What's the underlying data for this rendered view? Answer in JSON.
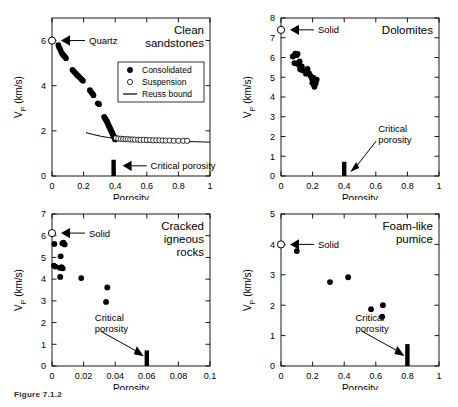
{
  "figure": {
    "caption": "Figure 7.1.2",
    "panel_count": 4
  },
  "chart_data": [
    {
      "type": "scatter",
      "title": "Clean sandstones",
      "xlabel": "Porosity",
      "ylabel": "VP (km/s)",
      "ylabel_main": "V",
      "ylabel_sub": "P",
      "ylabel_unit": " (km/s)",
      "xlim": [
        0,
        1
      ],
      "ylim": [
        0,
        7
      ],
      "xticks": [
        0,
        0.2,
        0.4,
        0.6,
        0.8,
        1
      ],
      "xticklabels": [
        "0",
        "0.2",
        "0.4",
        "0.6",
        "0.8",
        "1"
      ],
      "yticks": [
        0,
        2,
        4,
        6
      ],
      "yticklabels": [
        "0",
        "2",
        "4",
        "6"
      ],
      "grid": false,
      "legend": {
        "position": "upper-right",
        "entries": [
          {
            "label": "Consolidated",
            "marker": "filled-circle"
          },
          {
            "label": "Suspension",
            "marker": "open-circle"
          },
          {
            "label": "Reuss bound",
            "marker": "line"
          }
        ]
      },
      "annotations": [
        {
          "text": "Quartz",
          "marker": "open-circle",
          "x": 0.0,
          "y": 6.0,
          "arrow": "left"
        },
        {
          "text": "Critical porosity",
          "x": 0.39,
          "y": 0.45,
          "arrow": "left"
        }
      ],
      "critical_porosity": 0.39,
      "series": [
        {
          "name": "Consolidated",
          "marker": "filled-circle",
          "points": [
            [
              0.04,
              5.8
            ],
            [
              0.045,
              5.7
            ],
            [
              0.052,
              5.62
            ],
            [
              0.058,
              5.5
            ],
            [
              0.065,
              5.42
            ],
            [
              0.072,
              5.35
            ],
            [
              0.08,
              5.3
            ],
            [
              0.088,
              5.22
            ],
            [
              0.13,
              4.7
            ],
            [
              0.14,
              4.62
            ],
            [
              0.15,
              4.55
            ],
            [
              0.158,
              4.48
            ],
            [
              0.168,
              4.42
            ],
            [
              0.178,
              4.35
            ],
            [
              0.188,
              4.28
            ],
            [
              0.196,
              4.22
            ],
            [
              0.24,
              3.8
            ],
            [
              0.248,
              3.72
            ],
            [
              0.256,
              3.65
            ],
            [
              0.262,
              3.58
            ],
            [
              0.29,
              3.22
            ],
            [
              0.298,
              3.18
            ],
            [
              0.33,
              2.62
            ],
            [
              0.336,
              2.55
            ],
            [
              0.342,
              2.48
            ],
            [
              0.348,
              2.42
            ],
            [
              0.352,
              2.35
            ],
            [
              0.356,
              2.28
            ],
            [
              0.36,
              2.22
            ],
            [
              0.364,
              2.16
            ],
            [
              0.368,
              2.1
            ],
            [
              0.372,
              2.04
            ],
            [
              0.376,
              1.98
            ],
            [
              0.38,
              1.92
            ],
            [
              0.384,
              1.86
            ],
            [
              0.388,
              1.8
            ],
            [
              0.392,
              1.74
            ],
            [
              0.396,
              1.68
            ],
            [
              0.4,
              1.62
            ]
          ]
        },
        {
          "name": "Suspension",
          "marker": "open-circle",
          "points": [
            [
              0.405,
              1.68
            ],
            [
              0.42,
              1.66
            ],
            [
              0.435,
              1.65
            ],
            [
              0.45,
              1.64
            ],
            [
              0.465,
              1.63
            ],
            [
              0.48,
              1.63
            ],
            [
              0.495,
              1.62
            ],
            [
              0.51,
              1.62
            ],
            [
              0.525,
              1.61
            ],
            [
              0.545,
              1.61
            ],
            [
              0.56,
              1.6
            ],
            [
              0.58,
              1.6
            ],
            [
              0.6,
              1.59
            ],
            [
              0.62,
              1.59
            ],
            [
              0.64,
              1.58
            ],
            [
              0.66,
              1.58
            ],
            [
              0.68,
              1.58
            ],
            [
              0.7,
              1.57
            ],
            [
              0.72,
              1.57
            ],
            [
              0.745,
              1.57
            ],
            [
              0.77,
              1.56
            ],
            [
              0.8,
              1.56
            ],
            [
              0.83,
              1.56
            ],
            [
              0.855,
              1.56
            ]
          ]
        },
        {
          "name": "Reuss bound",
          "marker": "line",
          "points": [
            [
              0.215,
              1.92
            ],
            [
              0.26,
              1.84
            ],
            [
              0.31,
              1.76
            ],
            [
              0.36,
              1.7
            ],
            [
              0.42,
              1.65
            ],
            [
              0.5,
              1.6
            ],
            [
              0.6,
              1.57
            ],
            [
              0.7,
              1.55
            ],
            [
              0.8,
              1.53
            ],
            [
              0.9,
              1.52
            ],
            [
              1.0,
              1.5
            ]
          ]
        }
      ]
    },
    {
      "type": "scatter",
      "title": "Dolomites",
      "xlabel": "Porosity",
      "ylabel": "VP (km/s)",
      "ylabel_main": "V",
      "ylabel_sub": "P",
      "ylabel_unit": " (km/s)",
      "xlim": [
        0,
        1
      ],
      "ylim": [
        0,
        8
      ],
      "xticks": [
        0,
        0.2,
        0.4,
        0.6,
        0.8,
        1
      ],
      "xticklabels": [
        "0",
        "0.2",
        "0.4",
        "0.6",
        "0.8",
        "1"
      ],
      "yticks": [
        0,
        1,
        2,
        3,
        4,
        5,
        6,
        7,
        8
      ],
      "yticklabels": [
        "0",
        "1",
        "2",
        "3",
        "4",
        "5",
        "6",
        "7",
        "8"
      ],
      "grid": false,
      "annotations": [
        {
          "text": "Solid",
          "marker": "open-circle",
          "x": 0.0,
          "y": 7.4,
          "arrow": "left"
        },
        {
          "text": "Critical porosity",
          "x": 0.4,
          "y": 0.4,
          "arrow": "down-left"
        }
      ],
      "critical_porosity": 0.4,
      "series": [
        {
          "name": "Dolomites",
          "marker": "filled-circle",
          "points": [
            [
              0.075,
              6.05
            ],
            [
              0.09,
              6.2
            ],
            [
              0.098,
              6.12
            ],
            [
              0.105,
              6.18
            ],
            [
              0.085,
              5.72
            ],
            [
              0.1,
              5.7
            ],
            [
              0.112,
              5.65
            ],
            [
              0.118,
              5.8
            ],
            [
              0.12,
              5.42
            ],
            [
              0.128,
              5.38
            ],
            [
              0.132,
              5.55
            ],
            [
              0.14,
              5.35
            ],
            [
              0.15,
              5.3
            ],
            [
              0.158,
              5.18
            ],
            [
              0.168,
              5.42
            ],
            [
              0.178,
              5.2
            ],
            [
              0.186,
              5.08
            ],
            [
              0.196,
              4.92
            ],
            [
              0.204,
              4.98
            ],
            [
              0.198,
              4.72
            ],
            [
              0.208,
              4.62
            ],
            [
              0.214,
              4.8
            ],
            [
              0.22,
              4.7
            ],
            [
              0.226,
              4.88
            ],
            [
              0.212,
              4.52
            ]
          ]
        }
      ]
    },
    {
      "type": "scatter",
      "title": "Cracked igneous rocks",
      "title_lines": [
        "Cracked",
        "igneous",
        "rocks"
      ],
      "xlabel": "Porosity",
      "ylabel": "VP (km/s)",
      "ylabel_main": "V",
      "ylabel_sub": "P",
      "ylabel_unit": " (km/s)",
      "xlim": [
        0,
        0.1
      ],
      "ylim": [
        0,
        7
      ],
      "xticks": [
        0,
        0.02,
        0.04,
        0.06,
        0.08,
        0.1
      ],
      "xticklabels": [
        "0",
        "0.02",
        "0.04",
        "0.06",
        "0.08",
        "0.1"
      ],
      "yticks": [
        0,
        1,
        2,
        3,
        4,
        5,
        6,
        7
      ],
      "yticklabels": [
        "0",
        "1",
        "2",
        "3",
        "4",
        "5",
        "6",
        "7"
      ],
      "grid": false,
      "annotations": [
        {
          "text": "Solid",
          "marker": "open-circle",
          "x": 0.0,
          "y": 6.12,
          "arrow": "left"
        },
        {
          "text": "Critical porosity",
          "text_lines": [
            "Critical",
            "porosity"
          ],
          "x": 0.06,
          "y": 0.4,
          "arrow": "down-right"
        }
      ],
      "critical_porosity": 0.06,
      "series": [
        {
          "name": "Cracked igneous rocks",
          "marker": "filled-circle",
          "points": [
            [
              0.0015,
              5.62
            ],
            [
              0.0065,
              5.65
            ],
            [
              0.0072,
              5.68
            ],
            [
              0.008,
              5.6
            ],
            [
              0.0055,
              5.05
            ],
            [
              0.0012,
              4.62
            ],
            [
              0.0022,
              4.58
            ],
            [
              0.005,
              4.52
            ],
            [
              0.006,
              4.55
            ],
            [
              0.0068,
              4.5
            ],
            [
              0.0052,
              4.1
            ],
            [
              0.0185,
              4.05
            ],
            [
              0.035,
              3.62
            ],
            [
              0.0342,
              2.95
            ]
          ]
        }
      ]
    },
    {
      "type": "scatter",
      "title": "Foam-like pumice",
      "title_lines": [
        "Foam-like",
        "pumice"
      ],
      "xlabel": "Porosity",
      "ylabel": "VP (km/s)",
      "ylabel_main": "V",
      "ylabel_sub": "P",
      "ylabel_unit": " (km/s)",
      "xlim": [
        0,
        1
      ],
      "ylim": [
        0,
        5
      ],
      "xticks": [
        0,
        0.2,
        0.4,
        0.6,
        0.8,
        1
      ],
      "xticklabels": [
        "0",
        "0.2",
        "0.4",
        "0.6",
        "0.8",
        "1"
      ],
      "yticks": [
        0,
        1,
        2,
        3,
        4,
        5
      ],
      "yticklabels": [
        "0",
        "1",
        "2",
        "3",
        "4",
        "5"
      ],
      "grid": false,
      "annotations": [
        {
          "text": "Solid",
          "marker": "open-circle",
          "x": 0.0,
          "y": 4.0,
          "arrow": "left"
        },
        {
          "text": "Critical porosity",
          "text_lines": [
            "Critical",
            "porosity"
          ],
          "x": 0.8,
          "y": 0.3,
          "arrow": "down-right"
        }
      ],
      "critical_porosity": 0.8,
      "series": [
        {
          "name": "Foam-like pumice",
          "marker": "filled-circle",
          "points": [
            [
              0.1,
              3.78
            ],
            [
              0.31,
              2.76
            ],
            [
              0.425,
              2.92
            ],
            [
              0.57,
              1.87
            ],
            [
              0.645,
              2.0
            ],
            [
              0.64,
              1.62
            ]
          ]
        }
      ]
    }
  ]
}
